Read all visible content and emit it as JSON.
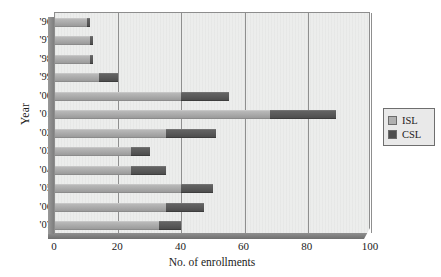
{
  "chart_data": {
    "type": "bar",
    "orientation": "horizontal",
    "stacked": true,
    "title": "",
    "xlabel": "No. of enrollments",
    "ylabel": "Year",
    "xlim": [
      0,
      100
    ],
    "xticks": [
      0,
      20,
      40,
      60,
      80,
      100
    ],
    "xtick_labels": [
      "0",
      "20",
      "40",
      "60",
      "80",
      "100"
    ],
    "grid": "vertical",
    "legend_position": "right",
    "categories": [
      "'96",
      "'97",
      "'98",
      "'99",
      "'00",
      "'01",
      "'02",
      "'03",
      "'04",
      "'05",
      "'06",
      "'07"
    ],
    "series": [
      {
        "name": "ISL",
        "color": "#b0b0b0",
        "values": [
          10,
          11,
          11,
          14,
          40,
          68,
          35,
          24,
          24,
          40,
          35,
          33
        ]
      },
      {
        "name": "CSL",
        "color": "#4e4e4e",
        "values": [
          1,
          1,
          1,
          6,
          15,
          21,
          16,
          6,
          11,
          10,
          12,
          7
        ]
      }
    ],
    "totals": [
      11,
      12,
      12,
      20,
      55,
      89,
      51,
      30,
      35,
      50,
      47,
      40
    ]
  },
  "axes": {
    "y_title": "Year",
    "x_title": "No. of enrollments"
  },
  "legend": {
    "items": [
      {
        "label": "ISL",
        "swatch": "isl"
      },
      {
        "label": "CSL",
        "swatch": "csl"
      }
    ]
  },
  "colors": {
    "plot_background": "#ecedec",
    "gridline": "#8f8f8f",
    "axis": "#7e7e7e",
    "isl": "#b0b0b0",
    "csl": "#4e4e4e",
    "text": "#1a1a1a"
  }
}
